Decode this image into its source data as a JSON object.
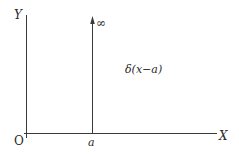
{
  "diagram": {
    "type": "dirac-delta-plot",
    "axes": {
      "y_label": "Y",
      "x_label": "X",
      "origin_label": "O"
    },
    "impulse": {
      "position_label": "a",
      "height_label": "∞"
    },
    "function_label": "δ(x−a)",
    "colors": {
      "line": "#3a3a3a",
      "text": "#2a2a2a",
      "background": "#ffffff"
    }
  }
}
